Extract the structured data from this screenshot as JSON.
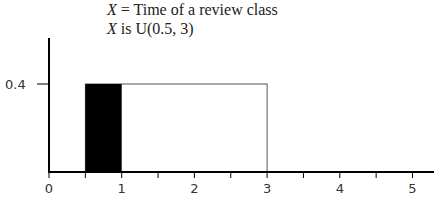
{
  "chart_data": {
    "type": "area",
    "title_lines": [
      {
        "var": "X",
        "text": " = Time of a review class"
      },
      {
        "var": "X",
        "text": " is U(0.5, 3)"
      }
    ],
    "distribution": "Uniform",
    "parameters": {
      "a": 0.5,
      "b": 3
    },
    "density": 0.4,
    "pdf_rectangle": {
      "x_start": 0.5,
      "x_end": 3,
      "height": 0.4
    },
    "shaded_region": {
      "x_start": 0.5,
      "x_end": 1,
      "color": "#000000"
    },
    "x_ticks": [
      0,
      0.5,
      1,
      1.5,
      2,
      2.5,
      3,
      3.5,
      4,
      4.5,
      5
    ],
    "x_tick_labels": [
      "0",
      "1",
      "2",
      "3",
      "4",
      "5"
    ],
    "y_ticks": [
      0.4
    ],
    "y_tick_labels": [
      "0.4"
    ],
    "xlim": [
      0,
      5.3
    ],
    "xlabel": "",
    "ylabel": "",
    "grid": false,
    "legend": null
  }
}
